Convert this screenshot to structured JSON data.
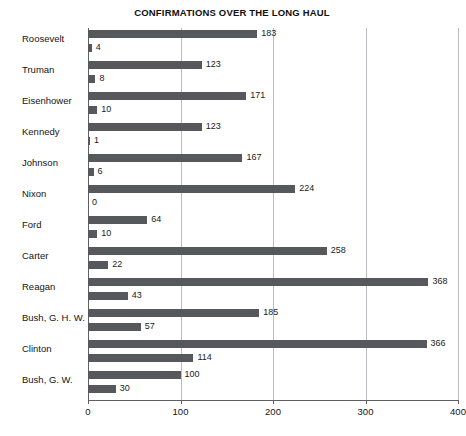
{
  "chart_data": {
    "type": "bar",
    "orientation": "horizontal",
    "title": "CONFIRMATIONS OVER THE LONG HAUL",
    "xlabel": "",
    "ylabel": "",
    "xlim": [
      0,
      400
    ],
    "grid": true,
    "gridlines": [
      0,
      100,
      200,
      300,
      400
    ],
    "xticks": [
      0,
      100,
      200,
      300,
      400
    ],
    "xtick_labels": [
      "0",
      "100",
      "200",
      "300",
      "400"
    ],
    "legend_position": "none",
    "categories": [
      "Roosevelt",
      "Truman",
      "Eisenhower",
      "Kennedy",
      "Johnson",
      "Nixon",
      "Ford",
      "Carter",
      "Reagan",
      "Bush, G. H. W.",
      "Clinton",
      "Bush, G. W."
    ],
    "series": [
      {
        "name": "primary",
        "values": [
          183,
          123,
          171,
          123,
          167,
          224,
          64,
          258,
          368,
          185,
          366,
          100
        ],
        "labels": [
          "183",
          "123",
          "171",
          "123",
          "167",
          "224",
          "64",
          "258",
          "368",
          "185",
          "366",
          "100"
        ]
      },
      {
        "name": "secondary",
        "values": [
          4,
          8,
          10,
          1,
          6,
          0,
          10,
          22,
          43,
          57,
          114,
          30
        ],
        "labels": [
          "4",
          "8",
          "10",
          "1",
          "6",
          "0",
          "10",
          "22",
          "43",
          "57",
          "114",
          "30"
        ]
      }
    ],
    "bar_color": "#56585c",
    "grid_color": "#b9bcc2",
    "axis_color": "#5d6064"
  },
  "edge_fragments": [
    "d",
    "n",
    "d",
    "-"
  ],
  "bottom_artifact": ""
}
